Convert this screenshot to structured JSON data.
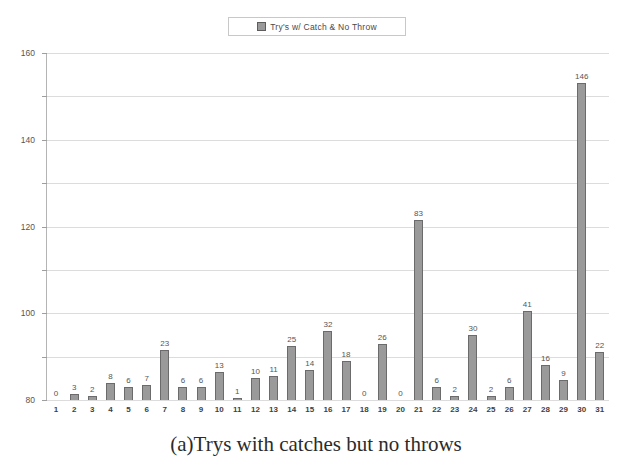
{
  "legend": {
    "marker_icon": "square-swatch-icon",
    "label": "Try's w/ Catch & No Throw",
    "color": "#9a9a9a"
  },
  "caption": "(a)Trys with catches but no throws",
  "chart_data": {
    "type": "bar",
    "title": "",
    "subtitle": "",
    "xlabel": "",
    "ylabel": "",
    "ylim": [
      0,
      160
    ],
    "yticks": [
      0,
      20,
      40,
      60,
      80,
      100,
      120,
      140,
      160
    ],
    "grid": true,
    "legend_position": "top-center",
    "bar_color": "#9a9a9a",
    "bar_edge_color": "#6b6b6b",
    "show_value_labels": true,
    "categories": [
      "1",
      "2",
      "3",
      "4",
      "5",
      "6",
      "7",
      "8",
      "9",
      "10",
      "11",
      "12",
      "13",
      "14",
      "15",
      "16",
      "17",
      "18",
      "19",
      "20",
      "21",
      "22",
      "23",
      "24",
      "25",
      "26",
      "27",
      "28",
      "29",
      "30",
      "31"
    ],
    "series": [
      {
        "name": "Try's w/ Catch & No Throw",
        "values": [
          0,
          3,
          2,
          8,
          6,
          7,
          23,
          6,
          6,
          13,
          1,
          10,
          11,
          25,
          14,
          32,
          18,
          0,
          26,
          0,
          83,
          6,
          2,
          30,
          2,
          6,
          41,
          16,
          9,
          146,
          22
        ]
      }
    ]
  }
}
